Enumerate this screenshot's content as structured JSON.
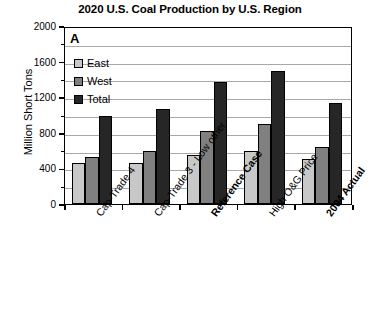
{
  "chart_data": {
    "type": "bar",
    "title": "2020 U.S. Coal Production by U.S. Region",
    "panel_label": "A",
    "xlabel": "",
    "ylabel": "Million Short Tons",
    "ylim": [
      0,
      2000
    ],
    "ytick_values": [
      0,
      400,
      800,
      1200,
      1600,
      2000
    ],
    "ytick_labels": [
      "0",
      "400",
      "800",
      "1200",
      "1600",
      "2000"
    ],
    "yminor_values": [
      200,
      600,
      1000,
      1400,
      1800
    ],
    "grid": true,
    "legend_position": "upper-left-inside",
    "categories": [
      "Cap-Trade 4",
      "Cap-Trade 3 - Low other",
      "Reference Case",
      "High O&G Price",
      "2004 Actual"
    ],
    "categories_bold": [
      false,
      false,
      true,
      false,
      true
    ],
    "series": [
      {
        "name": "East",
        "color": "#c8c8c8",
        "values": [
          460,
          460,
          550,
          600,
          510
        ]
      },
      {
        "name": "West",
        "color": "#808080",
        "values": [
          530,
          600,
          820,
          900,
          640
        ]
      },
      {
        "name": "Total",
        "color": "#262626",
        "values": [
          990,
          1070,
          1370,
          1490,
          1130
        ]
      }
    ]
  },
  "bottom_caption": ""
}
